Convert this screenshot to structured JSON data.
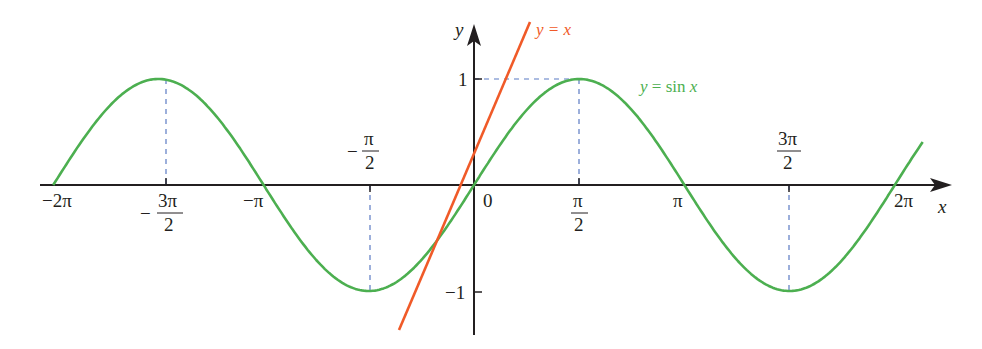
{
  "chart_data": {
    "type": "line",
    "title": "",
    "xlabel": "x",
    "ylabel": "y",
    "xlim": [
      -6.283,
      7.0
    ],
    "ylim": [
      -1.4,
      1.5
    ],
    "grid": false,
    "series": [
      {
        "name": "y = sin x",
        "color": "#4caf50",
        "function": "sin(x)",
        "x_range": [
          -6.283,
          6.7
        ],
        "points": [
          {
            "x": -6.283,
            "y": 0
          },
          {
            "x": -4.712,
            "y": 1
          },
          {
            "x": -3.142,
            "y": 0
          },
          {
            "x": -1.571,
            "y": -1
          },
          {
            "x": 0,
            "y": 0
          },
          {
            "x": 1.571,
            "y": 1
          },
          {
            "x": 3.142,
            "y": 0
          },
          {
            "x": 4.712,
            "y": -1
          },
          {
            "x": 6.283,
            "y": 0
          }
        ]
      },
      {
        "name": "y = x",
        "color": "#f05a28",
        "function": "x",
        "x_range": [
          -1.4,
          1.5
        ],
        "points": [
          {
            "x": -1.4,
            "y": -1.4
          },
          {
            "x": 1.5,
            "y": 1.5
          }
        ]
      }
    ],
    "x_ticks": [
      "−2π",
      "−3π/2",
      "−π",
      "−π/2",
      "0",
      "π/2",
      "π",
      "3π/2",
      "2π"
    ],
    "y_ticks": [
      "1",
      "−1"
    ],
    "annotations": [
      "dashed guide from (π/2, 1) to both axes",
      "dashed guides at x = ±π/2, ±3π/2 to extrema"
    ]
  },
  "labels": {
    "x_axis": "x",
    "y_axis": "y",
    "sin_curve": {
      "prefix": "y",
      "eq": " = sin ",
      "var": "x"
    },
    "line_curve": {
      "text": "y = x"
    },
    "x_ticks": {
      "neg2pi": "−2π",
      "neg3pi2_num": "3π",
      "neg3pi2_den": "2",
      "neg3pi2_sign": "−",
      "negpi": "−π",
      "negpi2_num": "π",
      "negpi2_den": "2",
      "negpi2_sign": "−",
      "zero": "0",
      "pi2_num": "π",
      "pi2_den": "2",
      "pi": "π",
      "threepi2_num": "3π",
      "threepi2_den": "2",
      "twopi": "2π"
    },
    "y_ticks": {
      "one": "1",
      "neg_one": "−1"
    }
  },
  "colors": {
    "sin": "#4caf50",
    "line": "#f05a28",
    "axis": "#231f20",
    "guide": "#5b7bc4"
  }
}
